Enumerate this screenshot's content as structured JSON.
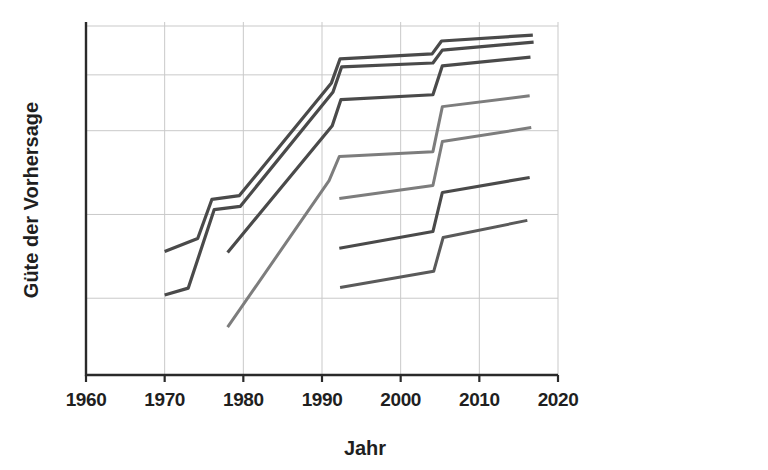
{
  "chart_data": {
    "type": "line",
    "title": "",
    "xlabel": "Jahr",
    "ylabel": "Güte der Vorhersage",
    "xlim": [
      1960,
      2020
    ],
    "ylim": [
      0,
      100
    ],
    "xticks": [
      1960,
      1970,
      1980,
      1990,
      2000,
      2010,
      2020
    ],
    "xtick_labels": [
      "1960",
      "1970",
      "1980",
      "1990",
      "2000",
      "2010",
      "2020"
    ],
    "yticks": [],
    "ytick_labels": [],
    "grid": "both",
    "grid_y_values": [
      22,
      46,
      70,
      86,
      100
    ],
    "legend": "none",
    "series": [
      {
        "name": "Serie 1",
        "color": "#4a4a4a",
        "width": 3.2,
        "points": [
          {
            "x": 1970.0,
            "y": 35.4
          },
          {
            "x": 1974.2,
            "y": 39.1
          },
          {
            "x": 1976.0,
            "y": 50.3
          },
          {
            "x": 1979.5,
            "y": 51.4
          },
          {
            "x": 1991.2,
            "y": 83.7
          },
          {
            "x": 1992.3,
            "y": 90.6
          },
          {
            "x": 2004.0,
            "y": 92.0
          },
          {
            "x": 2005.2,
            "y": 95.7
          },
          {
            "x": 2016.8,
            "y": 97.4
          }
        ]
      },
      {
        "name": "Serie 2",
        "color": "#4a4a4a",
        "width": 3.2,
        "points": [
          {
            "x": 1970.0,
            "y": 22.9
          },
          {
            "x": 1973.0,
            "y": 24.9
          },
          {
            "x": 1976.3,
            "y": 47.4
          },
          {
            "x": 1979.6,
            "y": 48.3
          },
          {
            "x": 1991.4,
            "y": 81.1
          },
          {
            "x": 1992.5,
            "y": 88.3
          },
          {
            "x": 2004.1,
            "y": 89.4
          },
          {
            "x": 2005.3,
            "y": 93.1
          },
          {
            "x": 2016.9,
            "y": 95.4
          }
        ]
      },
      {
        "name": "Serie 3",
        "color": "#4a4a4a",
        "width": 3.2,
        "points": [
          {
            "x": 1978.0,
            "y": 35.1
          },
          {
            "x": 1991.3,
            "y": 71.4
          },
          {
            "x": 1992.4,
            "y": 78.9
          },
          {
            "x": 2004.1,
            "y": 80.3
          },
          {
            "x": 2005.3,
            "y": 88.6
          },
          {
            "x": 2016.5,
            "y": 91.1
          }
        ]
      },
      {
        "name": "Serie 4",
        "color": "#7d7d7d",
        "width": 3.0,
        "points": [
          {
            "x": 1978.0,
            "y": 13.7
          },
          {
            "x": 1990.9,
            "y": 55.7
          },
          {
            "x": 1992.2,
            "y": 62.6
          },
          {
            "x": 2004.1,
            "y": 64.0
          },
          {
            "x": 2005.3,
            "y": 76.9
          },
          {
            "x": 2016.4,
            "y": 80.0
          }
        ]
      },
      {
        "name": "Serie 5",
        "color": "#7d7d7d",
        "width": 3.0,
        "points": [
          {
            "x": 1992.2,
            "y": 50.6
          },
          {
            "x": 2004.1,
            "y": 54.3
          },
          {
            "x": 2005.3,
            "y": 66.9
          },
          {
            "x": 2016.6,
            "y": 70.9
          }
        ]
      },
      {
        "name": "Serie 6",
        "color": "#4a4a4a",
        "width": 3.1,
        "points": [
          {
            "x": 1992.2,
            "y": 36.3
          },
          {
            "x": 2004.1,
            "y": 41.1
          },
          {
            "x": 2005.3,
            "y": 52.3
          },
          {
            "x": 2016.4,
            "y": 56.6
          }
        ]
      },
      {
        "name": "Serie 7",
        "color": "#5a5a5a",
        "width": 3.0,
        "points": [
          {
            "x": 1992.3,
            "y": 25.1
          },
          {
            "x": 2004.2,
            "y": 29.7
          },
          {
            "x": 2005.4,
            "y": 39.4
          },
          {
            "x": 2016.1,
            "y": 44.3
          }
        ]
      }
    ]
  },
  "axes": {
    "x_title": "Jahr",
    "y_title": "Güte der Vorhersage"
  }
}
